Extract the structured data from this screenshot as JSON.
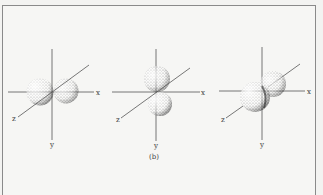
{
  "figure": {
    "caption": "(b)",
    "panels": [
      {
        "name": "px-orbital",
        "axes": {
          "x": "x",
          "y": "y",
          "z": "z"
        }
      },
      {
        "name": "py-orbital",
        "axes": {
          "x": "x",
          "y": "y",
          "z": "z"
        }
      },
      {
        "name": "pz-orbital",
        "axes": {
          "x": "x",
          "y": "y",
          "z": "z"
        }
      }
    ]
  }
}
